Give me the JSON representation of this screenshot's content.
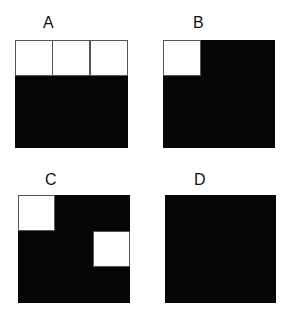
{
  "panels": [
    {
      "label": "A",
      "white_cells": [
        {
          "row": 0,
          "col": 0
        },
        {
          "row": 0,
          "col": 1
        },
        {
          "row": 0,
          "col": 2
        }
      ]
    },
    {
      "label": "B",
      "white_cells": [
        {
          "row": 0,
          "col": 0
        }
      ]
    },
    {
      "label": "C",
      "white_cells": [
        {
          "row": 0,
          "col": 0
        },
        {
          "row": 1,
          "col": 2
        }
      ]
    },
    {
      "label": "D",
      "white_cells": []
    }
  ],
  "grid": {
    "rows": 3,
    "cols": 3
  },
  "colors": {
    "filled": "#060606",
    "empty": "#ffffff",
    "border": "#555555"
  }
}
